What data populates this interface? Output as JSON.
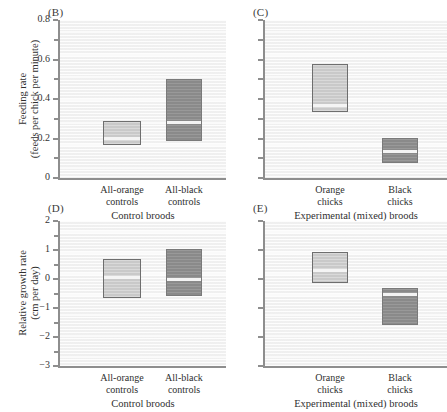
{
  "figure": {
    "panels": [
      {
        "tag": "(B)",
        "ylabel_line1": "Feeding rate",
        "ylabel_line2": "(feeds per chick per minute)",
        "ylim": [
          0,
          0.8
        ],
        "yticks": [
          0,
          0.2,
          0.4,
          0.6,
          0.8
        ],
        "yticklabels": [
          "0",
          "0.2",
          "0.4",
          "0.6",
          "0.8"
        ],
        "show_yticklabels": true,
        "categories": [
          "All-orange controls",
          "All-black controls"
        ],
        "category_lines": [
          [
            "All-orange",
            "controls"
          ],
          [
            "All-black",
            "controls"
          ]
        ],
        "group_label": "Control broods",
        "boxes": [
          {
            "name": "all-orange-controls",
            "fill": "light",
            "top": 0.29,
            "bottom": 0.165,
            "median": 0.21
          },
          {
            "name": "all-black-controls",
            "fill": "dark",
            "top": 0.5,
            "bottom": 0.185,
            "median": 0.29
          }
        ]
      },
      {
        "tag": "(C)",
        "ylabel_line1": "",
        "ylabel_line2": "",
        "ylim": [
          0,
          0.8
        ],
        "yticks": [
          0,
          0.1,
          0.2,
          0.3,
          0.4,
          0.5,
          0.6,
          0.7,
          0.8
        ],
        "yticklabels": [],
        "show_yticklabels": false,
        "categories": [
          "Orange chicks",
          "Black chicks"
        ],
        "category_lines": [
          [
            "Orange",
            "chicks"
          ],
          [
            "Black",
            "chicks"
          ]
        ],
        "group_label": "Experimental (mixed) broods",
        "boxes": [
          {
            "name": "orange-chicks",
            "fill": "light",
            "top": 0.575,
            "bottom": 0.335,
            "median": 0.375
          },
          {
            "name": "black-chicks",
            "fill": "dark",
            "top": 0.205,
            "bottom": 0.075,
            "median": 0.14
          }
        ]
      },
      {
        "tag": "(D)",
        "ylabel_line1": "Relative growth rate",
        "ylabel_line2": "(cm per day)",
        "ylim": [
          -3,
          2
        ],
        "yticks": [
          -3,
          -2,
          -1,
          0,
          1,
          2
        ],
        "yticklabels": [
          "−3",
          "−2",
          "−1",
          "0",
          "1",
          "2"
        ],
        "show_yticklabels": true,
        "categories": [
          "All-orange controls",
          "All-black controls"
        ],
        "category_lines": [
          [
            "All-orange",
            "controls"
          ],
          [
            "All-black",
            "controls"
          ]
        ],
        "group_label": "Control broods",
        "boxes": [
          {
            "name": "all-orange-controls",
            "fill": "light",
            "top": 0.68,
            "bottom": -0.66,
            "median": 0.1
          },
          {
            "name": "all-black-controls",
            "fill": "dark",
            "top": 1.05,
            "bottom": -0.57,
            "median": 0.03
          }
        ]
      },
      {
        "tag": "(E)",
        "ylabel_line1": "",
        "ylabel_line2": "",
        "ylim": [
          -3,
          2
        ],
        "yticks": [
          -3,
          -2,
          -1,
          0,
          1,
          2
        ],
        "yticklabels": [],
        "show_yticklabels": false,
        "categories": [
          "Orange chicks",
          "Black chicks"
        ],
        "category_lines": [
          [
            "Orange",
            "chicks"
          ],
          [
            "Black",
            "chicks"
          ]
        ],
        "group_label": "Experimental (mixed) broods",
        "boxes": [
          {
            "name": "orange-chicks",
            "fill": "light",
            "top": 0.93,
            "bottom": -0.14,
            "median": 0.35
          },
          {
            "name": "black-chicks",
            "fill": "dark",
            "top": -0.31,
            "bottom": -1.6,
            "median": -0.5
          }
        ]
      }
    ]
  },
  "chart_data": {
    "type": "box",
    "title": "",
    "panels": [
      {
        "panel": "B",
        "ylabel": "Feeding rate (feeds per chick per minute)",
        "xlabel": "Control broods",
        "ylim": [
          0,
          0.8
        ],
        "yticks": [
          0,
          0.2,
          0.4,
          0.6,
          0.8
        ],
        "grid": false,
        "categories": [
          "All-orange controls",
          "All-black controls"
        ],
        "boxes": [
          {
            "category": "All-orange controls",
            "color": "light-gray",
            "upper": 0.29,
            "median": 0.21,
            "lower": 0.165
          },
          {
            "category": "All-black controls",
            "color": "dark-gray",
            "upper": 0.5,
            "median": 0.29,
            "lower": 0.185
          }
        ]
      },
      {
        "panel": "C",
        "ylabel": "Feeding rate (feeds per chick per minute)",
        "xlabel": "Experimental (mixed) broods",
        "ylim": [
          0,
          0.8
        ],
        "yticks": [
          0,
          0.1,
          0.2,
          0.3,
          0.4,
          0.5,
          0.6,
          0.7,
          0.8
        ],
        "grid": false,
        "categories": [
          "Orange chicks",
          "Black chicks"
        ],
        "boxes": [
          {
            "category": "Orange chicks",
            "color": "light-gray",
            "upper": 0.575,
            "median": 0.375,
            "lower": 0.335
          },
          {
            "category": "Black chicks",
            "color": "dark-gray",
            "upper": 0.205,
            "median": 0.14,
            "lower": 0.075
          }
        ]
      },
      {
        "panel": "D",
        "ylabel": "Relative growth rate (cm per day)",
        "xlabel": "Control broods",
        "ylim": [
          -3,
          2
        ],
        "yticks": [
          -3,
          -2,
          -1,
          0,
          1,
          2
        ],
        "grid": false,
        "categories": [
          "All-orange controls",
          "All-black controls"
        ],
        "boxes": [
          {
            "category": "All-orange controls",
            "color": "light-gray",
            "upper": 0.68,
            "median": 0.1,
            "lower": -0.66
          },
          {
            "category": "All-black controls",
            "color": "dark-gray",
            "upper": 1.05,
            "median": 0.03,
            "lower": -0.57
          }
        ]
      },
      {
        "panel": "E",
        "ylabel": "Relative growth rate (cm per day)",
        "xlabel": "Experimental (mixed) broods",
        "ylim": [
          -3,
          2
        ],
        "yticks": [
          -3,
          -2,
          -1,
          0,
          1,
          2
        ],
        "grid": false,
        "categories": [
          "Orange chicks",
          "Black chicks"
        ],
        "boxes": [
          {
            "category": "Orange chicks",
            "color": "light-gray",
            "upper": 0.93,
            "median": 0.35,
            "lower": -0.14
          },
          {
            "category": "Black chicks",
            "color": "dark-gray",
            "upper": -0.31,
            "median": -0.5,
            "lower": -1.6
          }
        ]
      }
    ],
    "colors": {
      "light_box": "#c9c9c9",
      "dark_box": "#8a8a8a",
      "plot_bg": "#f2f2f2",
      "axis": "#8e8e8e"
    }
  }
}
